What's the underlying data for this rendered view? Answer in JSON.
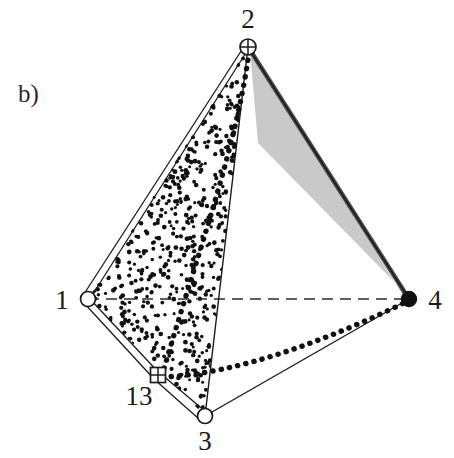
{
  "figure": {
    "panel_label": "b)",
    "type": "tetrahedron-diagram",
    "background_color": "#ffffff",
    "line_color": "#1a1a1a",
    "shade_color": "#c9c9c9",
    "shade_edge_color": "#4a4a4a",
    "stipple_color": "#111111",
    "width": 454,
    "height": 458
  },
  "vertices": [
    {
      "id": "v1",
      "label": "1",
      "x": 88,
      "y": 299,
      "marker": "open-circle",
      "label_x": 62,
      "label_y": 309
    },
    {
      "id": "v2",
      "label": "2",
      "x": 248,
      "y": 47,
      "marker": "crossed-circle",
      "label_x": 248,
      "label_y": 28
    },
    {
      "id": "v3",
      "label": "3",
      "x": 205,
      "y": 416,
      "marker": "open-circle",
      "label_x": 205,
      "label_y": 450
    },
    {
      "id": "v4",
      "label": "4",
      "x": 409,
      "y": 299,
      "marker": "filled-circle",
      "label_x": 435,
      "label_y": 309
    },
    {
      "id": "v13",
      "label": "13",
      "x": 158,
      "y": 375,
      "marker": "crossed-square",
      "label_x": 139,
      "label_y": 405
    }
  ],
  "edges": [
    {
      "id": "e-1-2",
      "from": "1",
      "to": "2",
      "style": "double-line",
      "visible": true
    },
    {
      "id": "e-1-13",
      "from": "1",
      "to": "13",
      "style": "double-line",
      "visible": true
    },
    {
      "id": "e-13-3",
      "from": "13",
      "to": "3",
      "style": "double-line",
      "visible": true
    },
    {
      "id": "e-2-3",
      "from": "2",
      "to": "3",
      "style": "solid-thin",
      "visible": true
    },
    {
      "id": "e-3-4",
      "from": "3",
      "to": "4",
      "style": "solid-thin",
      "visible": true
    },
    {
      "id": "e-2-4",
      "from": "2",
      "to": "4",
      "style": "solid-thin",
      "visible": true
    },
    {
      "id": "e-1-4",
      "from": "1",
      "to": "4",
      "style": "dashed",
      "visible": false
    }
  ],
  "faces": [
    {
      "id": "face-1-2-3",
      "vertices": [
        "1",
        "2",
        "3"
      ],
      "fill": "stipple",
      "label": "stippled-face"
    },
    {
      "id": "face-2-4-shade",
      "vertices": [
        "2",
        "4"
      ],
      "fill": "gray",
      "label": "shaded-band"
    }
  ],
  "curves": [
    {
      "id": "curve-2-13",
      "from": "2",
      "to": "13",
      "style": "thick-dotted",
      "label": "dotted-seam-upper"
    },
    {
      "id": "curve-13-4",
      "from": "13",
      "to": "4",
      "style": "thick-dotted",
      "label": "dotted-seam-lower"
    }
  ],
  "markers": {
    "open-circle": "○",
    "filled-circle": "●",
    "crossed-circle": "⊕",
    "crossed-square": "⊞"
  }
}
